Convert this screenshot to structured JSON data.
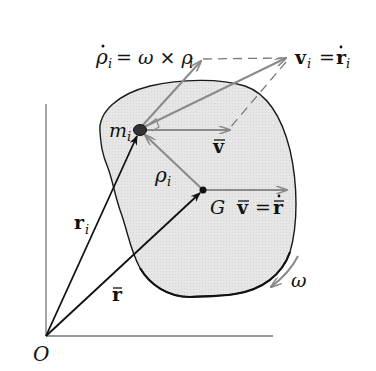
{
  "diagram": {
    "colors": {
      "body_fill": "#e4e4e4",
      "body_outline": "#1a1a1a",
      "position_vectors": "#111111",
      "velocity_vectors": "#8a8a8a",
      "dashed_lines": "#7a7a7a",
      "axes": "#777777",
      "particle": "#333333"
    },
    "labels": {
      "origin": "O",
      "center_of_mass": "G",
      "particle": "m",
      "particle_sub": "i",
      "r_i": "r",
      "r_i_sub": "i",
      "r_bar": "r",
      "rho_i": "ρ",
      "rho_i_sub": "i",
      "v_bar_at_particle": "v",
      "v_bar_eq_lhs": "v",
      "v_bar_eq_eq": "=",
      "v_bar_eq_rhs": "r",
      "rho_dot_lhs": "ρ",
      "rho_dot_sub": "i",
      "rho_dot_eq": "= ω × ρ",
      "rho_dot_rhs_sub": "i",
      "v_i_lhs": "v",
      "v_i_sub": "i",
      "v_i_eq": "=",
      "v_i_rhs": "r",
      "v_i_rhs_sub": "i",
      "omega": "ω"
    },
    "points": {
      "O": [
        46,
        336
      ],
      "G": [
        203,
        190
      ],
      "m_i": [
        140,
        130
      ],
      "rho_dot_tip": [
        203,
        59
      ],
      "v_i_tip": [
        288,
        58
      ],
      "v_bar_tip_at_particle": [
        230,
        130
      ],
      "v_bar_tip_at_G": [
        287,
        190
      ]
    }
  }
}
